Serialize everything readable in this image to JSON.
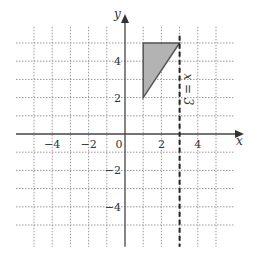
{
  "diagram": {
    "axes": {
      "x_label": "x",
      "y_label": "y"
    },
    "x_ticks": [
      {
        "v": -4,
        "t": "−4"
      },
      {
        "v": -2,
        "t": "−2"
      },
      {
        "v": 2,
        "t": "2"
      },
      {
        "v": 4,
        "t": "4"
      }
    ],
    "y_ticks": [
      {
        "v": 4,
        "t": "4"
      },
      {
        "v": 2,
        "t": "2"
      },
      {
        "v": -2,
        "t": "−2"
      },
      {
        "v": -4,
        "t": "−4"
      }
    ],
    "origin_label": "0",
    "grid_range": {
      "x": [
        -5,
        5
      ],
      "y": [
        -5,
        5
      ]
    },
    "dashed_line": {
      "label": "x = 3",
      "x": 3
    },
    "shaded_triangle": {
      "vertices": [
        [
          1,
          2
        ],
        [
          1,
          5
        ],
        [
          3,
          5
        ]
      ],
      "fill": "#b3b3b3",
      "stroke": "#555555"
    }
  }
}
